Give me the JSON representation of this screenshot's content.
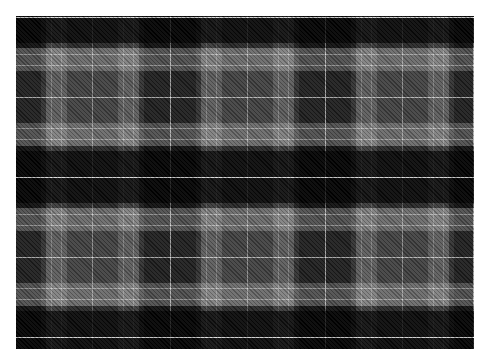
{
  "image": {
    "subject": "tartan-plaid-fabric-pattern",
    "palette": {
      "black": "#0a0a0a",
      "dark_grey": "#2e2e2e",
      "mid_grey": "#4a4a4a",
      "light_grey": "#8a8a8a",
      "white_line": "#e6e6e6",
      "background": "#ffffff"
    },
    "repeat": {
      "horizontal_period_px": 155,
      "vertical_period_px": 160
    }
  }
}
